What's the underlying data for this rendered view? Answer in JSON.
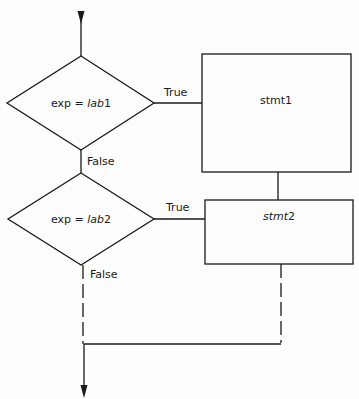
{
  "diagram": {
    "type": "flowchart",
    "decisions": [
      {
        "id": "d1",
        "label_prefix": "exp = ",
        "label_var": "lab",
        "label_suffix": "1",
        "true_label": "True",
        "false_label": "False"
      },
      {
        "id": "d2",
        "label_prefix": "exp = ",
        "label_var": "lab",
        "label_suffix": "2",
        "true_label": "True",
        "false_label": "False"
      }
    ],
    "statements": [
      {
        "id": "s1",
        "label_var": "stmt",
        "label_suffix": "1"
      },
      {
        "id": "s2",
        "label_var": "stmt",
        "label_suffix": "2"
      }
    ],
    "colors": {
      "stroke": "#1a1a1a",
      "background": "#fdfdfd"
    }
  }
}
